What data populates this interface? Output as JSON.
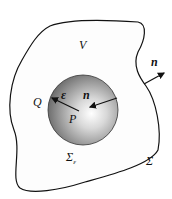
{
  "diagram": {
    "type": "region-with-excluded-sphere",
    "labels": {
      "volume": "V",
      "outer_normal": "n",
      "inner_normal": "n",
      "radius": "ε",
      "point_center": "P",
      "point_surface": "Q",
      "inner_surface": "Σ",
      "inner_surface_sub": "ε",
      "outer_surface": "Σ"
    },
    "colors": {
      "outline": "#111111",
      "sphere_center": "#ffffff",
      "sphere_edge": "#6e6e6e",
      "background": "#ffffff"
    }
  }
}
